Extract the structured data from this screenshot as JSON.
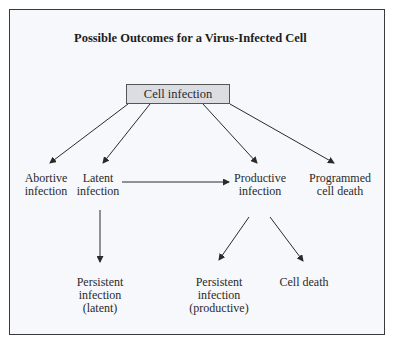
{
  "diagram": {
    "title": "Possible Outcomes for a Virus-Infected Cell",
    "root": "Cell infection",
    "nodes": {
      "abortive": "Abortive\ninfection",
      "latent": "Latent\ninfection",
      "productive": "Productive\ninfection",
      "programmed_death": "Programmed\ncell death",
      "persistent_latent": "Persistent\ninfection\n(latent)",
      "persistent_productive": "Persistent\ninfection\n(productive)",
      "cell_death": "Cell death"
    },
    "edges": [
      [
        "Cell infection",
        "Abortive infection"
      ],
      [
        "Cell infection",
        "Latent infection"
      ],
      [
        "Cell infection",
        "Productive infection"
      ],
      [
        "Cell infection",
        "Programmed cell death"
      ],
      [
        "Latent infection",
        "Productive infection"
      ],
      [
        "Latent infection",
        "Persistent infection (latent)"
      ],
      [
        "Productive infection",
        "Persistent infection (productive)"
      ],
      [
        "Productive infection",
        "Cell death"
      ]
    ]
  }
}
